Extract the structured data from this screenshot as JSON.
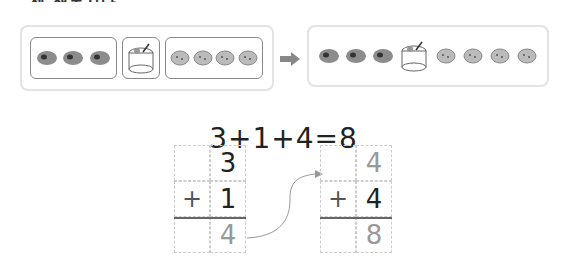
{
  "header": {
    "cut_text": "셈 해봅시다."
  },
  "left_panel": {
    "groups": [
      {
        "name": "snail-breads",
        "count": 3,
        "icon": "snail-bread-icon"
      },
      {
        "name": "cake",
        "count": 1,
        "icon": "cake-icon"
      },
      {
        "name": "cookies",
        "count": 4,
        "icon": "cookie-icon"
      }
    ]
  },
  "arrow": {
    "icon": "right-arrow-icon",
    "color": "#888888"
  },
  "right_panel": {
    "items": [
      "snail-bread",
      "snail-bread",
      "snail-bread",
      "cake",
      "cookie",
      "cookie",
      "cookie",
      "cookie"
    ]
  },
  "equation": {
    "text": "3+1+4=8"
  },
  "calc_left": {
    "top": "3",
    "operator": "+",
    "second": "1",
    "result": "4"
  },
  "calc_right": {
    "top": "4",
    "operator": "+",
    "second": "4",
    "result": "8"
  },
  "colors": {
    "panel_border": "#e3e3e3",
    "group_border": "#888888",
    "light_digit": "#999999",
    "dark_digit": "#222222"
  }
}
